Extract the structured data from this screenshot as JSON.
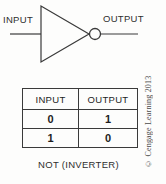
{
  "figure": {
    "caption": "NOT (INVERTER)",
    "copyright": "© Cengage Learning 2013"
  },
  "gate": {
    "type": "NOT (inverter) gate symbol",
    "input_label": "INPUT",
    "output_label": "OUTPUT"
  },
  "truth_table": {
    "headers": [
      "INPUT",
      "OUTPUT"
    ],
    "rows": [
      [
        "0",
        "1"
      ],
      [
        "1",
        "0"
      ]
    ]
  },
  "colors": {
    "line": "#3a3a3a",
    "text": "#2e2e2e",
    "copyright_text": "#4a4a4a",
    "background": "#fdfdfc"
  }
}
